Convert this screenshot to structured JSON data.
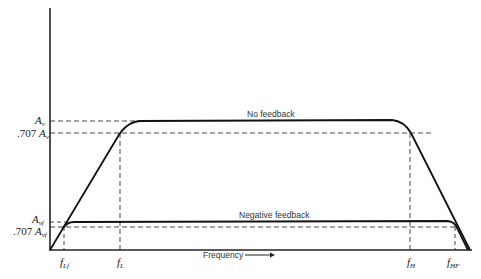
{
  "diagram": {
    "type": "frequency-response",
    "curves": [
      {
        "name": "No feedback",
        "label": "No feedback",
        "gain_label": "A_v",
        "half_power_label": ".707 A_v",
        "f_low": "f_L",
        "f_high": "f_H"
      },
      {
        "name": "Negative feedback",
        "label": "Negative feedback",
        "gain_label": "A_vf",
        "half_power_label": ".707 A_vf",
        "f_low": "f_Lf",
        "f_high": "f_HF"
      }
    ],
    "x_axis_label": "Frequency",
    "x_axis_arrow": "→"
  },
  "labels": {
    "av_base": "A",
    "av_sub": "v",
    "av707_prefix": ".707 ",
    "avf_sub": "vf",
    "fL": "f",
    "fL_sub": "L",
    "fLf_sub": "Lf",
    "fH_sub": "H",
    "fHF_sub": "HF",
    "no_feedback": "No feedback",
    "negative_feedback": "Negative feedback",
    "frequency": "Frequency"
  }
}
